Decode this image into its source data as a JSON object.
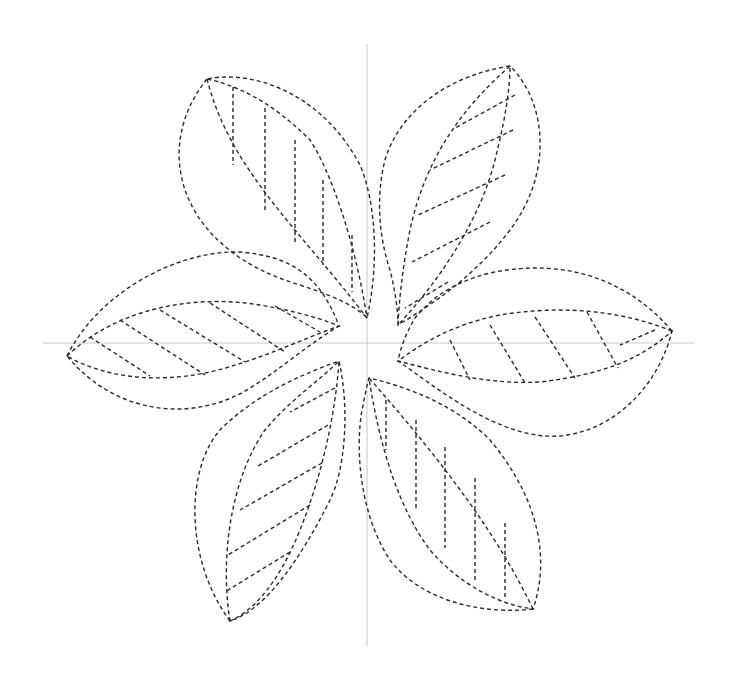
{
  "title": "Six-petal flower stitching pattern",
  "colors": {
    "background": "#ffffff",
    "stitch": "#2a2a2a",
    "guide": "#c8c8c8"
  },
  "stitch_style": {
    "dash": "4 3",
    "width": 1.4
  },
  "guides": {
    "vertical": {
      "x": 367,
      "y1": 44,
      "y2": 646
    },
    "horizontal": {
      "y": 343,
      "x1": 43,
      "x2": 695
    }
  },
  "petals": [
    {
      "id": "top-left",
      "outer": "M207,79 C150,150 180,250 300,285 C330,295 355,305 367,318 C380,260 375,200 360,165 C320,90 250,70 207,79 Z",
      "inner": "M207,79 C230,170 300,230 367,318 C355,240 330,170 310,140 C270,100 235,85 207,79 Z",
      "veins": [
        "M233,87 L233,165",
        "M265,108 L265,210",
        "M295,140 L295,245",
        "M323,180 L323,265",
        "M352,235 L352,292"
      ]
    },
    {
      "id": "top-right",
      "outer": "M510,66 C450,75 400,110 385,160 C375,200 380,240 390,270 C395,290 398,310 398,325 C440,300 480,270 510,230 C555,170 545,100 510,66 Z",
      "inner": "M510,66 C460,110 425,160 410,230 C403,265 399,300 398,325 C440,280 480,220 495,160 C505,120 510,90 510,66 Z",
      "veins": [
        "M515,95 L455,128",
        "M513,130 L430,170",
        "M505,175 L418,215",
        "M490,222 L412,262",
        "M448,282 L405,308"
      ]
    },
    {
      "id": "left",
      "outer": "M67,356 C100,290 180,250 240,252 C290,256 320,275 339,326 C300,350 280,370 250,388 C200,420 120,420 67,356 Z",
      "inner": "M67,356 C120,305 200,295 260,305 C300,312 325,320 339,326 C300,340 260,360 210,372 C150,385 100,375 67,356 Z",
      "veins": [
        "M90,337 L150,376",
        "M120,320 L205,375",
        "M160,310 L245,362",
        "M210,303 L285,352",
        "M275,306 L320,332"
      ]
    },
    {
      "id": "right",
      "outer": "M672,331 C620,270 550,260 490,273 C450,283 430,300 415,318 C405,335 400,350 398,361 C440,390 500,440 560,436 C620,430 660,380 672,331 Z",
      "inner": "M672,331 C620,310 560,305 500,315 C450,325 420,345 398,361 C440,372 490,385 540,382 C600,375 640,360 672,331 Z",
      "veins": [
        "M655,330 L620,345",
        "M587,312 L618,368",
        "M535,317 L575,378",
        "M490,325 L525,383",
        "M450,340 L470,380"
      ]
    },
    {
      "id": "bottom-left",
      "outer": "M230,621 C185,560 185,470 220,430 C255,395 300,375 339,361 C350,410 345,470 330,500 C300,560 265,610 230,621 Z",
      "inner": "M230,621 C220,560 230,480 265,430 C290,400 320,380 339,361 C335,420 320,480 300,530 C280,580 255,610 230,621 Z",
      "veins": [
        "M335,388 L290,412",
        "M328,425 L258,466",
        "M322,463 L240,510",
        "M310,505 L228,555",
        "M290,552 L225,592"
      ]
    },
    {
      "id": "bottom-right",
      "outer": "M533,609 C480,615 420,600 390,560 C360,515 355,450 362,410 C365,395 367,385 369,378 C420,390 460,410 490,440 C540,500 550,560 533,609 Z",
      "inner": "M533,609 C500,540 450,470 369,378 C380,450 400,510 430,550 C460,585 500,605 533,609 Z",
      "veins": [
        "M386,400 L386,450",
        "M416,420 L416,508",
        "M445,447 L445,548",
        "M475,478 L475,580",
        "M505,523 L505,600"
      ]
    }
  ]
}
